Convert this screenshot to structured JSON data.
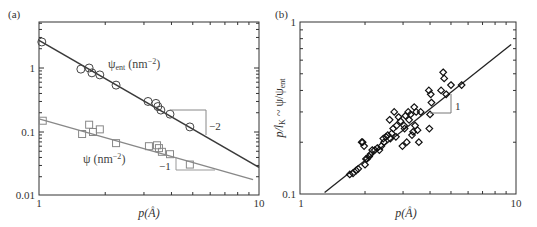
{
  "chart_data": [
    {
      "type": "scatter",
      "panel_label": "(a)",
      "xlabel": "p(Å)",
      "ylabel": "",
      "xscale": "log",
      "yscale": "log",
      "xlim": [
        1,
        10
      ],
      "ylim": [
        0.01,
        5.2
      ],
      "x_tick_labels": [
        "1",
        "10"
      ],
      "y_tick_labels": [
        "0.01",
        "0.1",
        "1"
      ],
      "grid": false,
      "series": [
        {
          "name": "ψent (nm−2)",
          "label_main": "ψ",
          "label_sub": "ent",
          "label_unit": " (nm",
          "label_sup": "−2",
          "label_close": ")",
          "marker": "circle",
          "color": "#444444",
          "x": [
            1.03,
            1.55,
            1.69,
            1.74,
            1.89,
            2.24,
            3.13,
            3.4,
            3.47,
            3.58,
            3.94,
            4.85
          ],
          "y": [
            2.55,
            0.96,
            1.0,
            0.84,
            0.78,
            0.54,
            0.3,
            0.28,
            0.25,
            0.22,
            0.19,
            0.12
          ],
          "fit_line": {
            "x": [
              1.0,
              10.0
            ],
            "y": [
              2.7,
              0.028
            ]
          },
          "slope_annotation": "−2"
        },
        {
          "name": "ψ (nm−2)",
          "label_main": "ψ",
          "label_unit": " (nm",
          "label_sup": "−2",
          "label_close": ")",
          "marker": "square",
          "color": "#888888",
          "x": [
            1.04,
            1.57,
            1.69,
            1.76,
            1.89,
            2.24,
            3.16,
            3.44,
            3.51,
            3.62,
            3.94,
            4.85
          ],
          "y": [
            0.15,
            0.093,
            0.13,
            0.1,
            0.11,
            0.067,
            0.06,
            0.062,
            0.056,
            0.049,
            0.045,
            0.031
          ],
          "fit_line": {
            "x": [
              1.0,
              9.4
            ],
            "y": [
              0.16,
              0.018
            ]
          },
          "slope_annotation": "−1"
        }
      ]
    },
    {
      "type": "scatter",
      "panel_label": "(b)",
      "xlabel": "p(Å)",
      "ylabel": "p/lK ~ ψ/ψent",
      "ylabel_parts": {
        "p": "p/l",
        "k": "K",
        "mid": " ~ ψ/ψ",
        "ent": "ent"
      },
      "xscale": "log",
      "yscale": "log",
      "xlim": [
        1,
        10
      ],
      "ylim": [
        0.1,
        1
      ],
      "x_tick_labels": [
        "1",
        "10"
      ],
      "y_tick_labels": [
        "0.1",
        "1"
      ],
      "grid": false,
      "series": [
        {
          "name": "data",
          "marker": "diamond",
          "color": "#111111",
          "x": [
            1.7,
            1.76,
            1.82,
            1.86,
            1.93,
            1.95,
            1.98,
            2.0,
            2.02,
            2.04,
            2.09,
            2.12,
            2.16,
            2.22,
            2.28,
            2.33,
            2.38,
            2.43,
            2.45,
            2.5,
            2.55,
            2.6,
            2.62,
            2.66,
            2.7,
            2.73,
            2.78,
            2.8,
            2.86,
            2.92,
            2.98,
            3.03,
            3.05,
            3.08,
            3.12,
            3.17,
            3.2,
            3.25,
            3.3,
            3.34,
            3.38,
            3.41,
            3.45,
            3.5,
            3.55,
            3.62,
            3.95,
            3.97,
            4.0,
            4.03,
            4.06,
            4.5,
            4.6,
            4.65,
            4.75,
            5.0,
            5.6
          ],
          "y": [
            0.13,
            0.132,
            0.137,
            0.14,
            0.2,
            0.2,
            0.19,
            0.148,
            0.16,
            0.16,
            0.165,
            0.17,
            0.18,
            0.18,
            0.185,
            0.18,
            0.19,
            0.21,
            0.2,
            0.215,
            0.22,
            0.27,
            0.21,
            0.225,
            0.24,
            0.3,
            0.215,
            0.25,
            0.28,
            0.265,
            0.19,
            0.25,
            0.24,
            0.285,
            0.2,
            0.3,
            0.27,
            0.29,
            0.22,
            0.23,
            0.32,
            0.25,
            0.3,
            0.235,
            0.2,
            0.3,
            0.4,
            0.24,
            0.29,
            0.38,
            0.34,
            0.4,
            0.51,
            0.47,
            0.38,
            0.43,
            0.43
          ]
        }
      ],
      "fit_line": {
        "x": [
          1.3,
          9.5
        ],
        "y": [
          0.102,
          0.74
        ]
      },
      "slope_annotation": "1"
    }
  ]
}
